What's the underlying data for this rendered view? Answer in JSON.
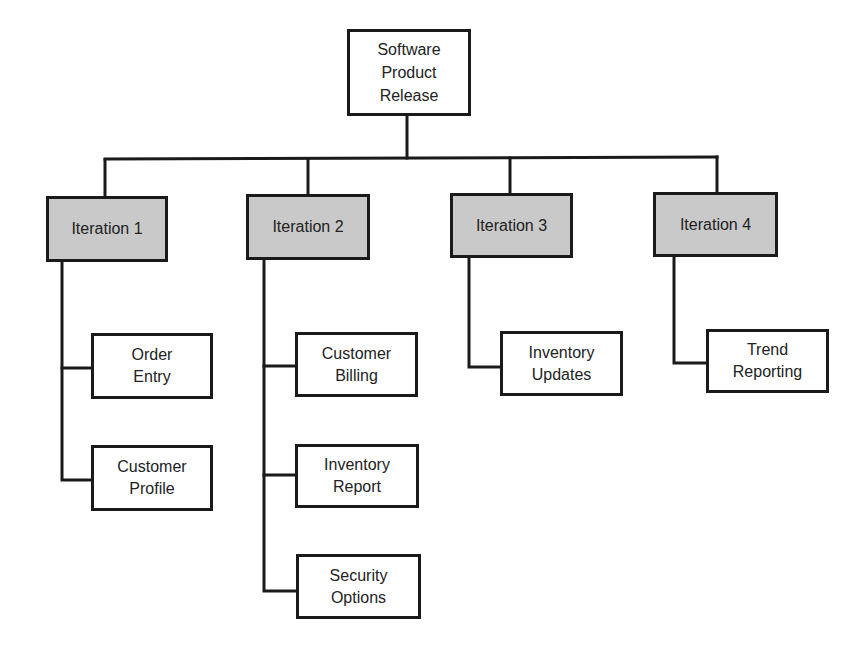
{
  "diagram": {
    "type": "hierarchy / work breakdown structure",
    "colors": {
      "line": "#1a1a1a",
      "iteration_fill": "#c9c9c9",
      "leaf_fill": "#ffffff",
      "text": "#222222"
    },
    "root": {
      "label": "Software\nProduct\nRelease"
    },
    "iterations": [
      {
        "label": "Iteration 1",
        "children": [
          {
            "label": "Order\nEntry"
          },
          {
            "label": "Customer\nProfile"
          }
        ]
      },
      {
        "label": "Iteration 2",
        "children": [
          {
            "label": "Customer\nBilling"
          },
          {
            "label": "Inventory\nReport"
          },
          {
            "label": "Security\nOptions"
          }
        ]
      },
      {
        "label": "Iteration 3",
        "children": [
          {
            "label": "Inventory\nUpdates"
          }
        ]
      },
      {
        "label": "Iteration 4",
        "children": [
          {
            "label": "Trend\nReporting"
          }
        ]
      }
    ]
  }
}
